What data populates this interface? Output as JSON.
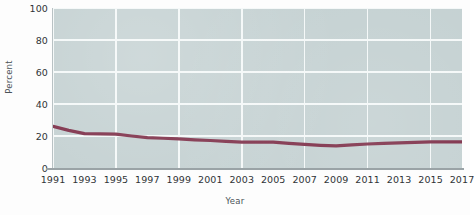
{
  "chart_data": {
    "type": "line",
    "title": "",
    "xlabel": "Year",
    "ylabel": "Percent",
    "ylim": [
      0,
      100
    ],
    "xlim": [
      1991,
      2017
    ],
    "yticks": [
      0,
      20,
      40,
      60,
      80,
      100
    ],
    "ytick_labels": [
      "0",
      "20",
      "40",
      "60",
      "80",
      "100"
    ],
    "xticks": [
      1991,
      1993,
      1995,
      1997,
      1999,
      2001,
      2003,
      2005,
      2007,
      2009,
      2011,
      2013,
      2015,
      2017
    ],
    "xtick_labels": [
      "1991",
      "1993",
      "1995",
      "1997",
      "1999",
      "2001",
      "2003",
      "2005",
      "2007",
      "2009",
      "2011",
      "2013",
      "2015",
      "2017"
    ],
    "gridlines": {
      "horizontal": true,
      "vertical": true,
      "vertical_every": 4,
      "color": "#f4f8f8"
    },
    "legend": null,
    "plot_background": "#c3d0d1",
    "line_color": "#7b2b45",
    "line_width": 3.2,
    "x": [
      1991,
      1992,
      1993,
      1994,
      1995,
      1996,
      1997,
      1998,
      1999,
      2000,
      2001,
      2002,
      2003,
      2004,
      2005,
      2006,
      2007,
      2008,
      2009,
      2010,
      2011,
      2012,
      2013,
      2014,
      2015,
      2016,
      2017
    ],
    "values": [
      26,
      23.5,
      21.5,
      21.3,
      21.2,
      20,
      19,
      18.6,
      18.2,
      17.6,
      17.2,
      16.6,
      16.2,
      16.2,
      16.2,
      15.4,
      14.8,
      14.2,
      13.8,
      14.4,
      15.0,
      15.4,
      15.7,
      16.0,
      16.3,
      16.3,
      16.3
    ],
    "series": [
      {
        "name": "Percent",
        "color": "#7b2b45",
        "values": [
          26,
          23.5,
          21.5,
          21.3,
          21.2,
          20,
          19,
          18.6,
          18.2,
          17.6,
          17.2,
          16.6,
          16.2,
          16.2,
          16.2,
          15.4,
          14.8,
          14.2,
          13.8,
          14.4,
          15.0,
          15.4,
          15.7,
          16.0,
          16.3,
          16.3,
          16.3
        ]
      }
    ]
  }
}
